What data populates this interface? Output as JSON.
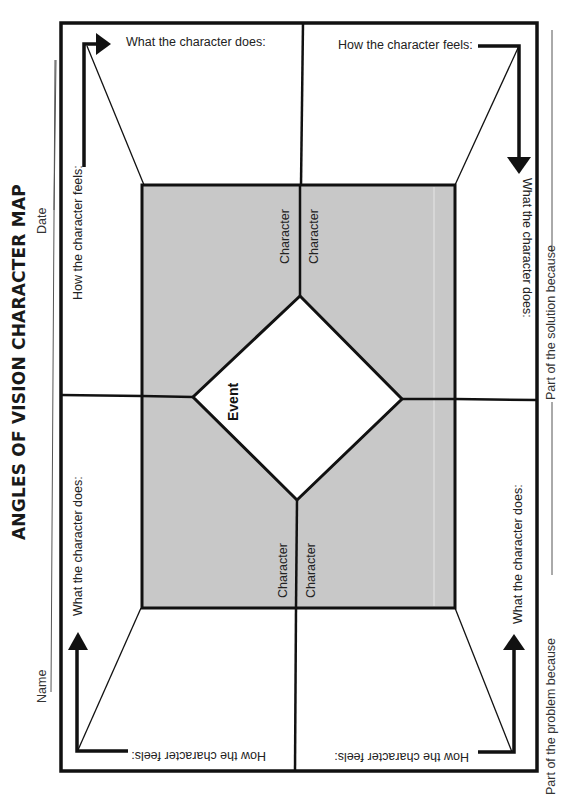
{
  "title": "ANGLES OF VISION CHARACTER MAP",
  "header_fields": {
    "name_label": "Name",
    "date_label": "Date"
  },
  "footer_fields": {
    "problem_label": "Part of the problem because",
    "solution_label": "Part of the solution because"
  },
  "center": {
    "event_label": "Event",
    "characters": [
      "Character",
      "Character",
      "Character",
      "Character"
    ]
  },
  "quadrants": {
    "top_left": {
      "does_label": "What the character does:",
      "feels_label": "How the character feels:"
    },
    "top_right": {
      "feels_label": "How the character feels:",
      "does_label": "What the character does:"
    },
    "bottom_left": {
      "does_label": "What the character does:",
      "feels_label": "How the character feels:"
    },
    "bottom_right": {
      "does_label": "What the character does:",
      "feels_label": "How the character feels:"
    }
  },
  "colors": {
    "frame": "#111111",
    "center_fill": "#c8c8c8",
    "diamond_fill": "#ffffff",
    "background": "#ffffff"
  }
}
